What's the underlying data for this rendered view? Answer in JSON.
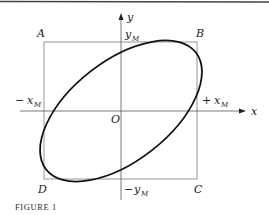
{
  "figure": {
    "caption": "FIGURE 1",
    "corners": {
      "A": "A",
      "B": "B",
      "C": "C",
      "D": "D"
    },
    "origin": "O",
    "axes": {
      "x": "x",
      "y": "y"
    },
    "bounds": {
      "plus_x": {
        "sign": "+",
        "var": "x",
        "sub": "M"
      },
      "minus_x": {
        "sign": "−",
        "var": "x",
        "sub": "M"
      },
      "plus_y": {
        "sign": "",
        "var": "y",
        "sub": "M"
      },
      "minus_y": {
        "sign": "−",
        "var": "y",
        "sub": "M"
      }
    },
    "colors": {
      "curve": "#111111",
      "box": "#8a8a8a",
      "axis": "#555555",
      "rule": "#444444"
    }
  }
}
